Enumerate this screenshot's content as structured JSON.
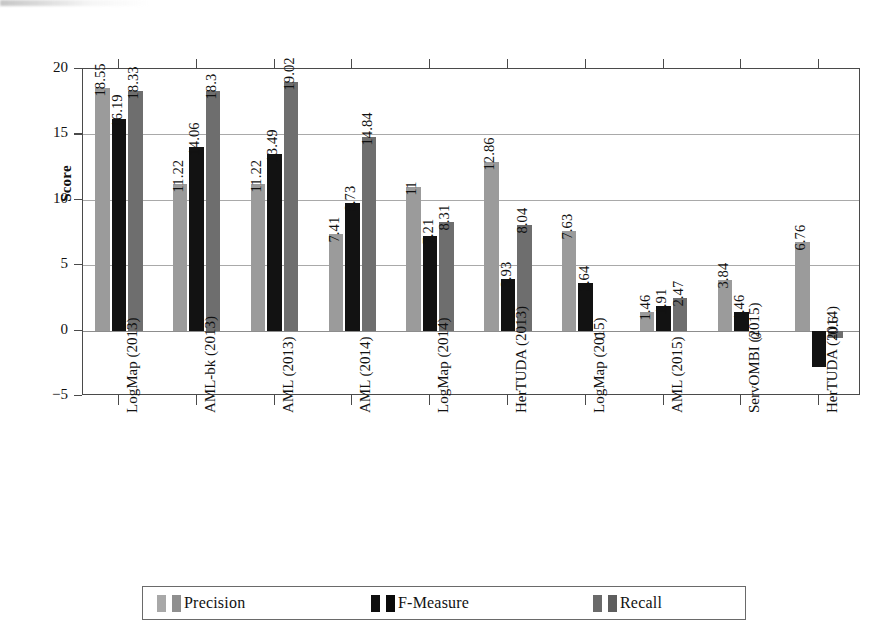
{
  "chart_data": {
    "type": "bar",
    "title": "",
    "subtitle": "",
    "xlabel": "",
    "ylabel": "Score",
    "ylim": [
      -5,
      20
    ],
    "yticks": [
      20,
      15,
      10,
      5,
      0,
      -5
    ],
    "ytick_labels": [
      "20",
      "15",
      "10",
      "5",
      "0",
      "−5"
    ],
    "grid": true,
    "grid_axis": "y",
    "legend_position": "bottom",
    "orientation": "vertical",
    "grouped": true,
    "categories": [
      "LogMap  (2013)",
      "AML-bk  (2013)",
      "AML  (2013)",
      "AML  (2014)",
      "LogMap  (2014)",
      "HerTUDA  (2013)",
      "LogMap  (2015)",
      "AML  (2015)",
      "ServOMBI  (2015)",
      "HerTUDA  (2014)"
    ],
    "series": [
      {
        "name": "Precision",
        "color": "#9b9b9b",
        "values": [
          18.55,
          11.22,
          11.22,
          7.41,
          11,
          12.86,
          7.63,
          1.46,
          3.84,
          6.76
        ],
        "labels": [
          "18.55",
          "11.22",
          "11.22",
          "7.41",
          "11",
          "12.86",
          "7.63",
          "1.46",
          "3.84",
          "6.76"
        ]
      },
      {
        "name": "F-Measure",
        "color": "#121212",
        "values": [
          16.19,
          14.06,
          13.49,
          9.73,
          7.21,
          3.93,
          3.64,
          1.91,
          1.46,
          -2.75
        ],
        "labels": [
          "16.19",
          "14.06",
          "13.49",
          "9.73",
          "7.21",
          "3.93",
          "3.64",
          "1.91",
          "1.46",
          ""
        ]
      },
      {
        "name": "Recall",
        "color": "#6e6e6e",
        "values": [
          18.33,
          18.3,
          19.02,
          14.84,
          8.31,
          8.04,
          0,
          2.47,
          0,
          -0.6
        ],
        "labels": [
          "18.33",
          "18.3",
          "19.02",
          "14.84",
          "8.31",
          "8.04",
          "0",
          "2.47",
          "0",
          "-0.6"
        ]
      }
    ]
  },
  "axis": {
    "y_title": "Score"
  },
  "legend": {
    "items": [
      {
        "label": "Precision",
        "swatch": "precision"
      },
      {
        "label": "F-Measure",
        "swatch": "fmeasure"
      },
      {
        "label": "Recall",
        "swatch": "recall"
      }
    ]
  }
}
